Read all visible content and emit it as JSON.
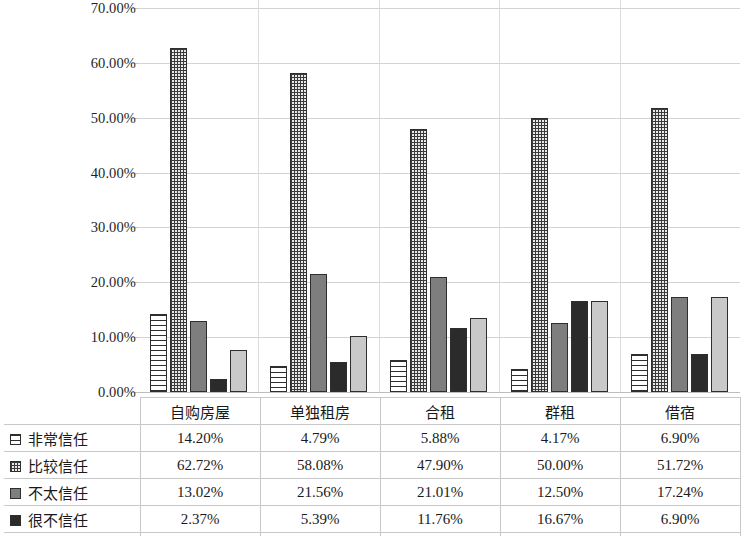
{
  "chart_data": {
    "type": "bar",
    "title": "",
    "subtitle": "",
    "xlabel": "",
    "ylabel": "",
    "ylim": [
      0,
      70
    ],
    "grid": true,
    "legend_position": "table-below",
    "y_ticks": [
      "0.00%",
      "10.00%",
      "20.00%",
      "30.00%",
      "40.00%",
      "50.00%",
      "60.00%",
      "70.00%"
    ],
    "y_tick_values": [
      0,
      10,
      20,
      30,
      40,
      50,
      60,
      70
    ],
    "categories": [
      "自购房屋",
      "单独租房",
      "合租",
      "群租",
      "借宿"
    ],
    "series": [
      {
        "name": "非常信任",
        "fill": "horizontal-stripes",
        "color": "#ffffff",
        "values": [
          14.2,
          4.79,
          5.88,
          4.17,
          6.9
        ],
        "labels": [
          "14.20%",
          "4.79%",
          "5.88%",
          "4.17%",
          "6.90%"
        ]
      },
      {
        "name": "比较信任",
        "fill": "dotted-checker",
        "color": "#e9e9e9",
        "values": [
          62.72,
          58.08,
          47.9,
          50.0,
          51.72
        ],
        "labels": [
          "62.72%",
          "58.08%",
          "47.90%",
          "50.00%",
          "51.72%"
        ]
      },
      {
        "name": "不太信任",
        "fill": "solid",
        "color": "#7e7e7e",
        "values": [
          13.02,
          21.56,
          21.01,
          12.5,
          17.24
        ],
        "labels": [
          "13.02%",
          "21.56%",
          "21.01%",
          "12.50%",
          "17.24%"
        ]
      },
      {
        "name": "很不信任",
        "fill": "solid",
        "color": "#2b2b2b",
        "values": [
          2.37,
          5.39,
          11.76,
          16.67,
          6.9
        ],
        "labels": [
          "2.37%",
          "5.39%",
          "11.76%",
          "16.67%",
          "6.90%"
        ]
      },
      {
        "name": "说不清",
        "fill": "solid",
        "color": "#c9c9c9",
        "values": [
          7.69,
          10.18,
          13.45,
          16.66,
          17.24
        ],
        "labels": [
          "7.69%",
          "10.18%",
          "13.45%",
          "16.66%",
          "17.24"
        ]
      }
    ]
  },
  "table": {
    "corner_label": "",
    "column_headers": [
      "自购房屋",
      "单独租房",
      "合租",
      "群租",
      "借宿"
    ],
    "rows": [
      {
        "label": "非常信任",
        "swatch": "legend-swatch-stripes",
        "cells": [
          "14.20%",
          "4.79%",
          "5.88%",
          "4.17%",
          "6.90%"
        ]
      },
      {
        "label": "比较信任",
        "swatch": "legend-swatch-dotted",
        "cells": [
          "62.72%",
          "58.08%",
          "47.90%",
          "50.00%",
          "51.72%"
        ]
      },
      {
        "label": "不太信任",
        "swatch": "legend-swatch-gray",
        "cells": [
          "13.02%",
          "21.56%",
          "21.01%",
          "12.50%",
          "17.24%"
        ]
      },
      {
        "label": "很不信任",
        "swatch": "legend-swatch-dark",
        "cells": [
          "2.37%",
          "5.39%",
          "11.76%",
          "16.67%",
          "6.90%"
        ]
      },
      {
        "label": "说不清",
        "swatch": "legend-swatch-light",
        "cells": [
          "7.69%",
          "10.18%",
          "13.45%",
          "16.66%",
          "17.24"
        ]
      }
    ]
  }
}
